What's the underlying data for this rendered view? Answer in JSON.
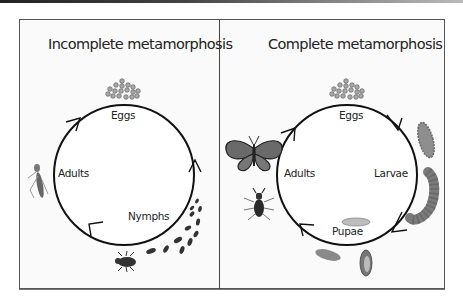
{
  "diagram": {
    "panels": [
      {
        "title": "Incomplete metamorphosis",
        "stages": [
          "Eggs",
          "Nymphs",
          "Adults"
        ]
      },
      {
        "title": "Complete metamorphosis",
        "stages": [
          "Eggs",
          "Larvae",
          "Pupae",
          "Adults"
        ]
      }
    ],
    "colors": {
      "line": "#111111",
      "frame": "#555555",
      "insect_dark": "#333333",
      "larva": "#8a8a8a",
      "egg": "#9a9a9a"
    },
    "icons": {
      "eggs": "egg-cluster-icon",
      "nymphs": "nymph-insects-icon",
      "adult_incomplete": "grasshopper-icon",
      "adult_butterfly": "butterfly-icon",
      "adult_beetle": "beetle-icon",
      "larvae": "caterpillar-icon",
      "pupae": "pupa-chrysalis-icon"
    }
  }
}
